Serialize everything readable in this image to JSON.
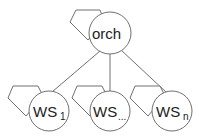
{
  "diagram": {
    "root": {
      "label": "orch"
    },
    "children": [
      {
        "label": "WS",
        "subscript": "1"
      },
      {
        "label": "WS",
        "subscript": "..."
      },
      {
        "label": "WS",
        "subscript": "n"
      }
    ],
    "colors": {
      "stroke": "#707070",
      "text": "#222222",
      "background": "#ffffff"
    }
  }
}
